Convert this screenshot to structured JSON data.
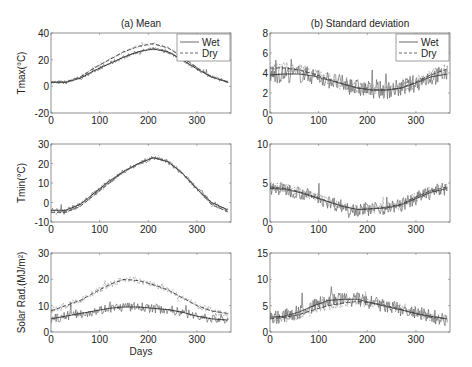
{
  "figure": {
    "col_titles": [
      "(a) Mean",
      "(b) Standard deviation"
    ],
    "xlabel": "Days"
  },
  "chart_data": [
    {
      "id": "tmax-mean",
      "type": "line",
      "title": "(a) Mean",
      "ylabel": "Tmax(°C)",
      "xlabel": "",
      "xlim": [
        0,
        370
      ],
      "ylim": [
        -20,
        40
      ],
      "xticks": [
        0,
        100,
        200,
        300
      ],
      "yticks": [
        -20,
        0,
        20,
        40
      ],
      "legend": [
        "Wet",
        "Dry"
      ],
      "legend_position": "upper right",
      "series": [
        {
          "name": "Wet",
          "style": "solid",
          "x": [
            0,
            30,
            60,
            90,
            120,
            150,
            180,
            210,
            240,
            270,
            300,
            330,
            365
          ],
          "values": [
            3,
            3,
            6,
            12,
            17,
            22,
            26,
            28,
            26,
            20,
            13,
            7,
            3
          ]
        },
        {
          "name": "Dry",
          "style": "dashed",
          "x": [
            0,
            30,
            60,
            90,
            120,
            150,
            180,
            210,
            240,
            270,
            300,
            330,
            365
          ],
          "values": [
            3,
            3,
            7,
            14,
            20,
            26,
            30,
            32,
            29,
            22,
            14,
            7,
            3
          ]
        }
      ]
    },
    {
      "id": "sd-tmax",
      "type": "line",
      "title": "(b) Standard deviation",
      "ylabel": "",
      "xlabel": "",
      "xlim": [
        0,
        370
      ],
      "ylim": [
        0,
        8
      ],
      "xticks": [
        0,
        100,
        200,
        300
      ],
      "yticks": [
        0,
        2,
        4,
        6,
        8
      ],
      "legend": [
        "Wet",
        "Dry"
      ],
      "legend_position": "upper right",
      "series": [
        {
          "name": "Wet",
          "style": "solid",
          "x": [
            0,
            30,
            60,
            90,
            120,
            150,
            180,
            210,
            240,
            270,
            300,
            330,
            365
          ],
          "values": [
            3.8,
            3.9,
            3.9,
            3.7,
            3.3,
            2.9,
            2.5,
            2.3,
            2.3,
            2.5,
            3.0,
            3.6,
            3.9
          ]
        },
        {
          "name": "Dry",
          "style": "dashed",
          "x": [
            0,
            30,
            60,
            90,
            120,
            150,
            180,
            210,
            240,
            270,
            300,
            330,
            365
          ],
          "values": [
            4.5,
            4.5,
            4.3,
            3.9,
            3.4,
            2.9,
            2.5,
            2.3,
            2.3,
            2.5,
            3.1,
            3.8,
            4.4
          ]
        }
      ]
    },
    {
      "id": "tmin-mean",
      "type": "line",
      "title": "",
      "ylabel": "Tmin(°C)",
      "xlabel": "",
      "xlim": [
        0,
        370
      ],
      "ylim": [
        -10,
        30
      ],
      "xticks": [
        0,
        100,
        200,
        300
      ],
      "yticks": [
        -10,
        0,
        10,
        20,
        30
      ],
      "series": [
        {
          "name": "Wet",
          "style": "solid",
          "x": [
            0,
            30,
            60,
            90,
            120,
            150,
            180,
            210,
            240,
            270,
            300,
            330,
            365
          ],
          "values": [
            -4,
            -4,
            -1,
            5,
            11,
            16,
            20,
            23,
            21,
            15,
            7,
            0,
            -4
          ]
        },
        {
          "name": "Dry",
          "style": "dashed",
          "x": [
            0,
            30,
            60,
            90,
            120,
            150,
            180,
            210,
            240,
            270,
            300,
            330,
            365
          ],
          "values": [
            -5,
            -5,
            -2,
            4,
            10,
            16,
            20,
            23,
            21,
            15,
            7,
            -1,
            -5
          ]
        }
      ]
    },
    {
      "id": "sd-tmin",
      "type": "line",
      "title": "",
      "ylabel": "",
      "xlabel": "",
      "xlim": [
        0,
        370
      ],
      "ylim": [
        0,
        10
      ],
      "xticks": [
        0,
        100,
        200,
        300
      ],
      "yticks": [
        0,
        5,
        10
      ],
      "series": [
        {
          "name": "Wet",
          "style": "solid",
          "x": [
            0,
            30,
            60,
            90,
            120,
            150,
            180,
            210,
            240,
            270,
            300,
            330,
            365
          ],
          "values": [
            4.3,
            4.2,
            3.8,
            3.2,
            2.6,
            2.0,
            1.6,
            1.7,
            1.8,
            2.2,
            3.0,
            3.8,
            4.3
          ]
        },
        {
          "name": "Dry",
          "style": "dashed",
          "x": [
            0,
            30,
            60,
            90,
            120,
            150,
            180,
            210,
            240,
            270,
            300,
            330,
            365
          ],
          "values": [
            4.5,
            4.3,
            3.9,
            3.3,
            2.6,
            2.0,
            1.6,
            1.7,
            1.9,
            2.3,
            3.2,
            4.0,
            4.5
          ]
        }
      ]
    },
    {
      "id": "rad-mean",
      "type": "line",
      "title": "",
      "ylabel": "Solar Rad.(MJ/m²)",
      "xlabel": "Days",
      "xlim": [
        0,
        370
      ],
      "ylim": [
        0,
        30
      ],
      "xticks": [
        0,
        100,
        200,
        300
      ],
      "yticks": [
        0,
        10,
        20,
        30
      ],
      "series": [
        {
          "name": "Wet",
          "style": "solid",
          "x": [
            0,
            30,
            60,
            90,
            120,
            150,
            180,
            210,
            240,
            270,
            300,
            330,
            365
          ],
          "values": [
            5,
            6,
            7,
            8,
            9,
            9.5,
            9.5,
            9,
            8.5,
            7.5,
            6,
            5,
            4.5
          ]
        },
        {
          "name": "Dry",
          "style": "dashed",
          "x": [
            0,
            30,
            60,
            90,
            120,
            150,
            180,
            210,
            240,
            270,
            300,
            330,
            365
          ],
          "values": [
            8,
            10,
            12,
            15,
            18,
            20,
            19.5,
            18,
            16,
            13,
            10,
            8,
            7
          ]
        }
      ]
    },
    {
      "id": "sd-rad",
      "type": "line",
      "title": "",
      "ylabel": "",
      "xlabel": "",
      "xlim": [
        0,
        370
      ],
      "ylim": [
        0,
        15
      ],
      "xticks": [
        0,
        100,
        200,
        300
      ],
      "yticks": [
        0,
        5,
        10,
        15
      ],
      "series": [
        {
          "name": "Wet",
          "style": "solid",
          "x": [
            0,
            30,
            60,
            90,
            120,
            150,
            180,
            210,
            240,
            270,
            300,
            330,
            365
          ],
          "values": [
            2.8,
            3.0,
            3.8,
            5.0,
            6.0,
            6.2,
            6.2,
            5.5,
            4.8,
            4.2,
            3.5,
            3.0,
            2.5
          ]
        },
        {
          "name": "Dry",
          "style": "dashed",
          "x": [
            0,
            30,
            60,
            90,
            120,
            150,
            180,
            210,
            240,
            270,
            300,
            330,
            365
          ],
          "values": [
            2.5,
            2.8,
            3.3,
            4.2,
            5.0,
            5.5,
            5.8,
            5.5,
            5.0,
            4.3,
            3.5,
            2.8,
            2.5
          ]
        }
      ]
    }
  ]
}
